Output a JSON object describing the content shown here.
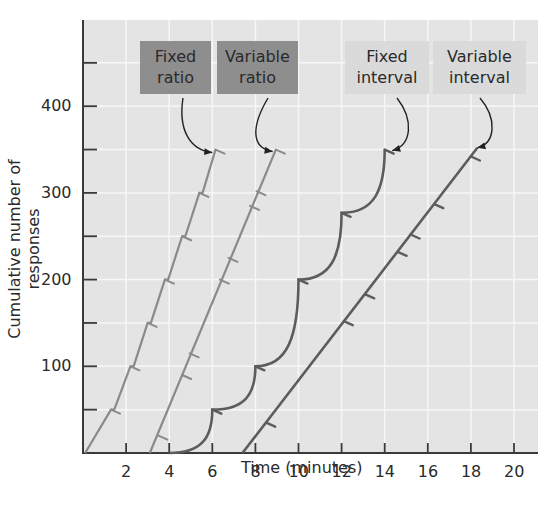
{
  "chart_data": {
    "type": "line",
    "title": "",
    "xlabel": "Time (minutes)",
    "ylabel": "Cumulative number of responses",
    "xlim": [
      0,
      21
    ],
    "ylim": [
      0,
      500
    ],
    "x_ticks": [
      2,
      4,
      6,
      8,
      10,
      12,
      14,
      16,
      18,
      20
    ],
    "y_ticks": [
      50,
      100,
      150,
      200,
      250,
      300,
      350,
      400,
      450
    ],
    "y_tick_labels": [
      100,
      200,
      300,
      400
    ],
    "grid": true,
    "legend_position": "callout labels at top with arrows",
    "series": [
      {
        "name": "Fixed ratio",
        "label_lines": [
          "Fixed",
          "ratio"
        ],
        "style": "light-gray stepped line, pause after each reinforcement",
        "color": "#8a8a8a",
        "points": [
          [
            0.1,
            0
          ],
          [
            1.3,
            50
          ],
          [
            1.45,
            50
          ],
          [
            2.2,
            100
          ],
          [
            2.35,
            100
          ],
          [
            3.0,
            150
          ],
          [
            3.15,
            150
          ],
          [
            3.8,
            200
          ],
          [
            3.95,
            200
          ],
          [
            4.6,
            250
          ],
          [
            4.75,
            250
          ],
          [
            5.4,
            300
          ],
          [
            5.55,
            300
          ],
          [
            6.15,
            350
          ]
        ],
        "reinforcements": [
          [
            1.3,
            50
          ],
          [
            2.2,
            100
          ],
          [
            3.0,
            150
          ],
          [
            3.8,
            200
          ],
          [
            4.6,
            250
          ],
          [
            5.4,
            300
          ],
          [
            6.15,
            350
          ]
        ]
      },
      {
        "name": "Variable ratio",
        "label_lines": [
          "Variable",
          "ratio"
        ],
        "style": "light-gray straight line",
        "color": "#8a8a8a",
        "points": [
          [
            3.1,
            0
          ],
          [
            8.95,
            350
          ]
        ],
        "reinforcements": [
          [
            3.5,
            20
          ],
          [
            4.6,
            90
          ],
          [
            4.95,
            115
          ],
          [
            6.35,
            200
          ],
          [
            6.75,
            225
          ],
          [
            7.75,
            285
          ],
          [
            8.05,
            302
          ],
          [
            8.95,
            350
          ]
        ]
      },
      {
        "name": "Fixed interval",
        "label_lines": [
          "Fixed",
          "interval"
        ],
        "style": "dark-gray scalloped curve",
        "color": "#5c5c5c",
        "points": [
          [
            4.0,
            0
          ],
          [
            6.0,
            50
          ],
          [
            8.0,
            100
          ],
          [
            10.0,
            200
          ],
          [
            12.0,
            277
          ],
          [
            14.0,
            350
          ]
        ],
        "reinforcements": [
          [
            6.0,
            50
          ],
          [
            8.0,
            100
          ],
          [
            10.0,
            200
          ],
          [
            12.0,
            277
          ],
          [
            14.0,
            350
          ]
        ]
      },
      {
        "name": "Variable interval",
        "label_lines": [
          "Variable",
          "interval"
        ],
        "style": "dark-gray straight line",
        "color": "#5c5c5c",
        "points": [
          [
            7.4,
            0
          ],
          [
            18.3,
            352
          ]
        ],
        "reinforcements": [
          [
            8.5,
            35
          ],
          [
            12.1,
            152
          ],
          [
            13.1,
            183
          ],
          [
            14.6,
            232
          ],
          [
            15.2,
            252
          ],
          [
            16.3,
            287
          ],
          [
            18.0,
            342
          ]
        ]
      }
    ]
  },
  "labels": {
    "fixed_ratio_1": "Fixed",
    "fixed_ratio_2": "ratio",
    "variable_ratio_1": "Variable",
    "variable_ratio_2": "ratio",
    "fixed_interval_1": "Fixed",
    "fixed_interval_2": "interval",
    "variable_interval_1": "Variable",
    "variable_interval_2": "interval"
  },
  "axes": {
    "xlabel": "Time (minutes)",
    "ylabel": "Cumulative number of responses",
    "x_tick_labels": [
      "2",
      "4",
      "6",
      "8",
      "10",
      "12",
      "14",
      "16",
      "18",
      "20"
    ],
    "y_tick_labels": [
      "100",
      "200",
      "300",
      "400"
    ]
  },
  "colors": {
    "plot_bg": "#e4e4e4",
    "grid": "#f7f7f7",
    "axis": "#3a3a3a",
    "ratio_line": "#8a8a8a",
    "interval_line": "#5c5c5c",
    "arrow": "#222222",
    "dark_label_bg": "#8e8e8e",
    "light_label_bg": "#dadada"
  }
}
